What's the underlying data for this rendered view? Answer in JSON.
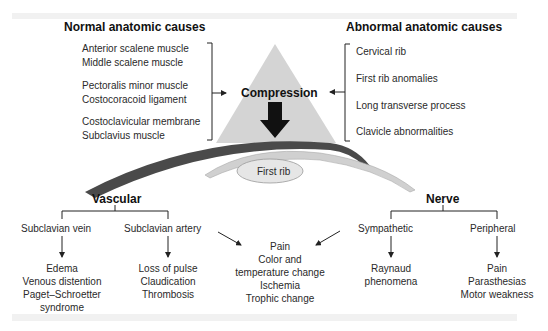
{
  "colors": {
    "triangle": "#d4d4d4",
    "clavicle": "#4a4a4a",
    "rib_arc": "#cfcfcf",
    "first_rib_fill": "#e6e6e6",
    "band": "#f1f1f1"
  },
  "normal": {
    "title": "Normal anatomic causes",
    "groups": [
      [
        "Anterior scalene muscle",
        "Middle scalene muscle"
      ],
      [
        "Pectoralis minor muscle",
        "Costocoracoid ligament"
      ],
      [
        "Costoclavicular membrane",
        "Subclavius muscle"
      ]
    ]
  },
  "abnormal": {
    "title": "Abnormal anatomic causes",
    "items": [
      "Cervical rib",
      "First rib anomalies",
      "Long transverse process",
      "Clavicle abnormalities"
    ]
  },
  "center": {
    "compression": "Compression",
    "first_rib": "First rib"
  },
  "vascular": {
    "title": "Vascular",
    "vein": {
      "label": "Subclavian vein",
      "effects": [
        "Edema",
        "Venous distention",
        "Paget–Schroetter",
        "syndrome"
      ]
    },
    "artery": {
      "label": "Subclavian artery",
      "effects": [
        "Loss of pulse",
        "Claudication",
        "Thrombosis"
      ]
    }
  },
  "shared_symptoms": [
    "Pain",
    "Color and",
    "temperature change",
    "Ischemia",
    "Trophic change"
  ],
  "nerve": {
    "title": "Nerve",
    "sympathetic": {
      "label": "Sympathetic",
      "effects": [
        "Raynaud",
        "phenomena"
      ]
    },
    "peripheral": {
      "label": "Peripheral",
      "effects": [
        "Pain",
        "Parasthesias",
        "Motor weakness"
      ]
    }
  }
}
